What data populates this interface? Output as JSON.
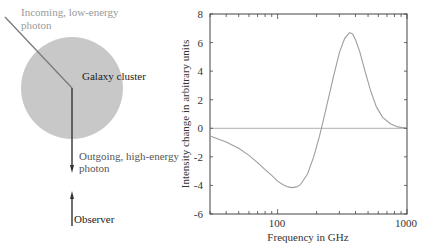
{
  "diagram": {
    "incoming_label_line1": "Incoming, low-energy",
    "incoming_label_line2": "photon",
    "cluster_label": "Galaxy cluster",
    "outgoing_label_line1": "Outgoing, high-energy",
    "outgoing_label_line2": "photon",
    "observer_label": "Observer",
    "colors": {
      "cluster_fill": "#c8c8c8",
      "incoming_line": "#7a7a7a",
      "incoming_text": "#9a9a9a",
      "outgoing_line": "#333333",
      "text": "#222222"
    }
  },
  "chart_data": {
    "type": "line",
    "title": "",
    "xlabel": "Frequency in GHz",
    "ylabel": "Intensity change in arbitrary units",
    "xscale": "log",
    "xlim": [
      30,
      1000
    ],
    "ylim": [
      -6,
      8
    ],
    "x_ticks": [
      "100",
      "1000"
    ],
    "y_ticks": [
      "8",
      "6",
      "4",
      "2",
      "0",
      "-2",
      "-4",
      "-6"
    ],
    "grid": false,
    "legend": null,
    "series": [
      {
        "name": "SZ intensity change",
        "x": [
          30,
          40,
          50,
          60,
          70,
          80,
          90,
          100,
          110,
          120,
          130,
          140,
          150,
          170,
          190,
          210,
          218,
          240,
          270,
          300,
          330,
          360,
          380,
          400,
          430,
          470,
          520,
          580,
          650,
          750,
          850,
          1000
        ],
        "y": [
          -0.55,
          -0.95,
          -1.4,
          -1.9,
          -2.4,
          -2.9,
          -3.3,
          -3.7,
          -3.95,
          -4.1,
          -4.15,
          -4.1,
          -3.95,
          -3.2,
          -2.0,
          -0.6,
          0.0,
          1.6,
          3.6,
          5.3,
          6.3,
          6.7,
          6.6,
          6.2,
          5.4,
          4.1,
          2.7,
          1.5,
          0.75,
          0.3,
          0.1,
          0.0
        ]
      },
      {
        "name": "zero line",
        "x": [
          30,
          1000
        ],
        "y": [
          0,
          0
        ]
      }
    ],
    "colors": {
      "curve": "#9e9e9e",
      "zero_line": "#b0b0b0",
      "axes": "#444444"
    }
  }
}
